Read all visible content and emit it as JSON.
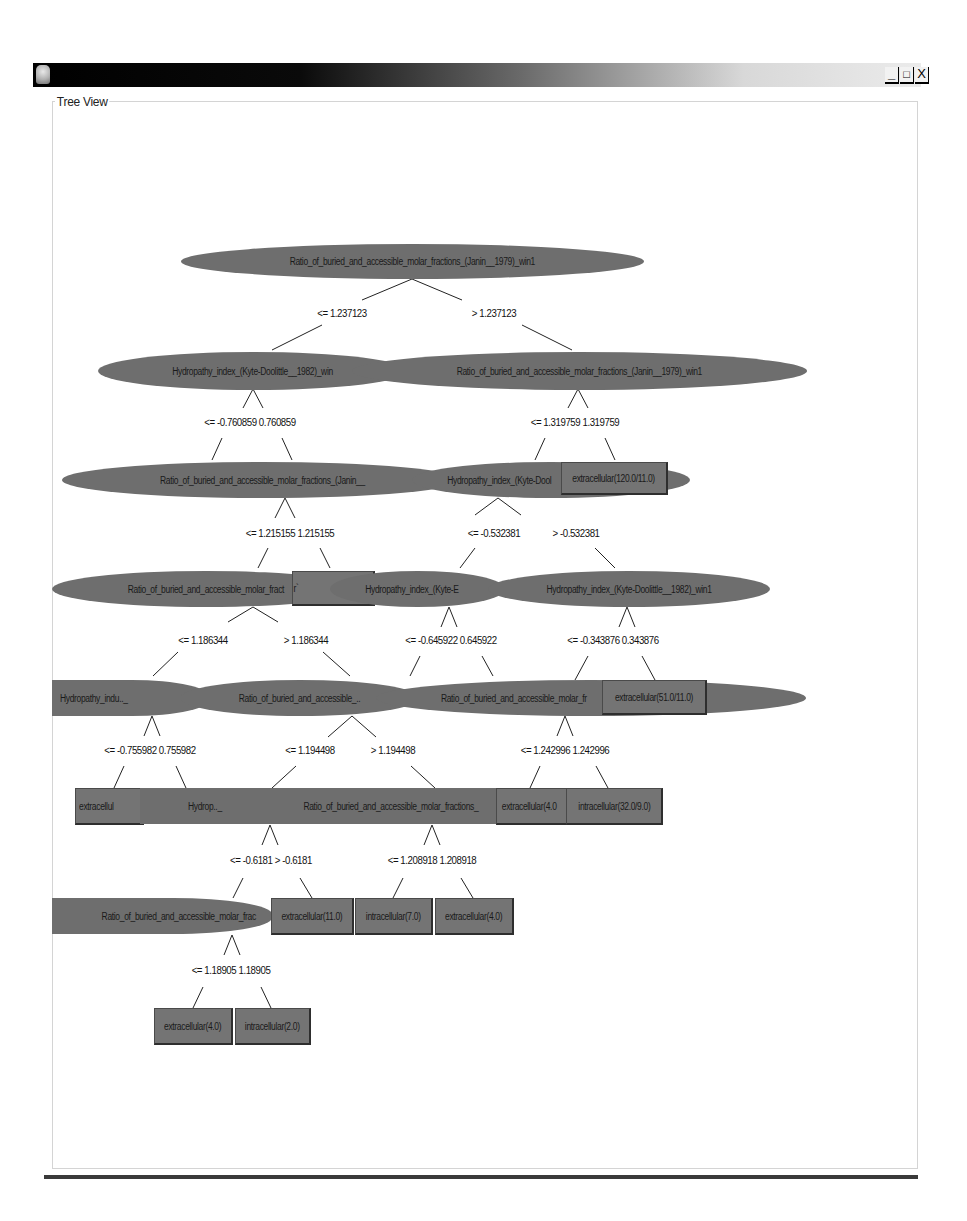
{
  "window": {
    "title": "",
    "controls": {
      "minimize": "_",
      "maximize": "□",
      "close": "X"
    }
  },
  "panel": {
    "title": "Tree View"
  },
  "colors": {
    "node_fill": "#6e6e6e",
    "edge": "#222222",
    "titlebar_start": "#000000",
    "titlebar_end": "#ebebeb"
  },
  "tree": {
    "nodes": [
      {
        "id": "n0",
        "type": "ellipse",
        "label": "Ratio_of_buried_and_accessible_molar_fractions_(Janin__1979)_win1"
      },
      {
        "id": "n1",
        "type": "ellipse",
        "label": "Hydropathy_index_(Kyte-Doolittle__1982)_win"
      },
      {
        "id": "n2",
        "type": "ellipse",
        "label": "Ratio_of_buried_and_accessible_molar_fractions_(Janin__1979)_win1"
      },
      {
        "id": "n3",
        "type": "ellipse",
        "label": "Ratio_of_buried_and_accessible_molar_fractions_(Janin__"
      },
      {
        "id": "n4",
        "type": "ellipse",
        "label": "Hydropathy_index_(Kyte-Dool"
      },
      {
        "id": "n5",
        "type": "leaf",
        "label": "extracellular(120.0/11.0)"
      },
      {
        "id": "n6",
        "type": "ellipse",
        "label": "Ratio_of_buried_and_accessible_molar_fract"
      },
      {
        "id": "n7",
        "type": "leaf",
        "label": "r`"
      },
      {
        "id": "n8",
        "type": "ellipse",
        "label": "Hydropathy_index_(Kyte-E"
      },
      {
        "id": "n9",
        "type": "ellipse",
        "label": "Hydropathy_index_(Kyte-Doolittle__1982)_win1"
      },
      {
        "id": "n10",
        "type": "ellipse",
        "label": "Hydropathy_indu.._"
      },
      {
        "id": "n11",
        "type": "ellipse",
        "label": "Ratio_of_buried_and_accessible_.."
      },
      {
        "id": "n12",
        "type": "ellipse",
        "label": "Ratio_of_buried_and_accessible_molar_fr"
      },
      {
        "id": "n13",
        "type": "leaf",
        "label": "extracellular(51.0/11.0)"
      },
      {
        "id": "n14",
        "type": "leaf",
        "label": "extracellul"
      },
      {
        "id": "n15",
        "type": "ellipse",
        "label": "Hydrop.._"
      },
      {
        "id": "n16",
        "type": "ellipse",
        "label": "Ratio_of_buried_and_accessible_molar_fractions_"
      },
      {
        "id": "n17",
        "type": "leaf",
        "label": "extracellular(4.0"
      },
      {
        "id": "n18",
        "type": "leaf",
        "label": "intracellular(32.0/9.0)"
      },
      {
        "id": "n19",
        "type": "ellipse",
        "label": "Ratio_of_buried_and_accessible_molar_frac"
      },
      {
        "id": "n20",
        "type": "leaf",
        "label": "extracellular(11.0)"
      },
      {
        "id": "n21",
        "type": "leaf",
        "label": "intracellular(7.0)"
      },
      {
        "id": "n22",
        "type": "leaf",
        "label": "extracellular(4.0)"
      },
      {
        "id": "n23",
        "type": "leaf",
        "label": "extracellular(4.0)"
      },
      {
        "id": "n24",
        "type": "leaf",
        "label": "intracellular(2.0)"
      }
    ],
    "edge_labels": [
      {
        "id": "e0",
        "text": "<= 1.237123"
      },
      {
        "id": "e1",
        "text": "> 1.237123"
      },
      {
        "id": "e2",
        "text": "<= -0.760859 0.760859"
      },
      {
        "id": "e3",
        "text": "<= 1.319759 1.319759"
      },
      {
        "id": "e4",
        "text": "<= 1.215155 1.215155"
      },
      {
        "id": "e5",
        "text": "<= -0.532381"
      },
      {
        "id": "e6",
        "text": "> -0.532381"
      },
      {
        "id": "e7",
        "text": "<= 1.186344"
      },
      {
        "id": "e8",
        "text": "> 1.186344"
      },
      {
        "id": "e9",
        "text": "<= -0.645922 0.645922"
      },
      {
        "id": "e10",
        "text": "<= -0.343876 0.343876"
      },
      {
        "id": "e11",
        "text": "<= -0.755982 0.755982"
      },
      {
        "id": "e12",
        "text": "<= 1.194498"
      },
      {
        "id": "e13",
        "text": "> 1.194498"
      },
      {
        "id": "e14",
        "text": "<= 1.242996 1.242996"
      },
      {
        "id": "e15",
        "text": "<= -0.6181 > -0.6181"
      },
      {
        "id": "e16",
        "text": "<= 1.208918 1.208918"
      },
      {
        "id": "e17",
        "text": "<= 1.18905 1.18905"
      }
    ]
  }
}
